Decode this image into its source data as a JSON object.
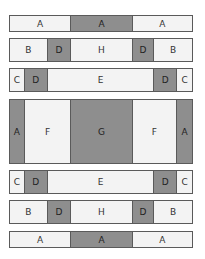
{
  "diagram": {
    "rows": [
      {
        "cells": [
          {
            "label": "A",
            "shade": "light",
            "span": 62
          },
          {
            "label": "A",
            "shade": "dark",
            "span": 62
          },
          {
            "label": "A",
            "shade": "light",
            "span": 60
          }
        ]
      },
      {
        "cells": [
          {
            "label": "B",
            "shade": "light",
            "span": 38
          },
          {
            "label": "D",
            "shade": "dark",
            "span": 24
          },
          {
            "label": "H",
            "shade": "light",
            "span": 62
          },
          {
            "label": "D",
            "shade": "dark",
            "span": 22
          },
          {
            "label": "B",
            "shade": "light",
            "span": 38
          }
        ]
      },
      {
        "cells": [
          {
            "label": "C",
            "shade": "light",
            "span": 15
          },
          {
            "label": "D",
            "shade": "dark",
            "span": 23
          },
          {
            "label": "E",
            "shade": "light",
            "span": 108
          },
          {
            "label": "D",
            "shade": "dark",
            "span": 23
          },
          {
            "label": "C",
            "shade": "light",
            "span": 15
          }
        ]
      },
      {
        "cells": [
          {
            "label": "A",
            "shade": "dark",
            "span": 15
          },
          {
            "label": "F",
            "shade": "light",
            "span": 47
          },
          {
            "label": "G",
            "shade": "dark",
            "span": 62
          },
          {
            "label": "F",
            "shade": "light",
            "span": 45
          },
          {
            "label": "A",
            "shade": "dark",
            "span": 15
          }
        ]
      },
      {
        "cells": [
          {
            "label": "C",
            "shade": "light",
            "span": 15
          },
          {
            "label": "D",
            "shade": "dark",
            "span": 23
          },
          {
            "label": "E",
            "shade": "light",
            "span": 108
          },
          {
            "label": "D",
            "shade": "dark",
            "span": 23
          },
          {
            "label": "C",
            "shade": "light",
            "span": 15
          }
        ]
      },
      {
        "cells": [
          {
            "label": "B",
            "shade": "light",
            "span": 38
          },
          {
            "label": "D",
            "shade": "dark",
            "span": 24
          },
          {
            "label": "H",
            "shade": "light",
            "span": 62
          },
          {
            "label": "D",
            "shade": "dark",
            "span": 22
          },
          {
            "label": "B",
            "shade": "light",
            "span": 38
          }
        ]
      },
      {
        "cells": [
          {
            "label": "A",
            "shade": "light",
            "span": 62
          },
          {
            "label": "A",
            "shade": "dark",
            "span": 62
          },
          {
            "label": "A",
            "shade": "light",
            "span": 60
          }
        ]
      }
    ],
    "colors": {
      "light": "#f3f3f3",
      "dark": "#8e8e8e",
      "border": "#5a5a5a"
    }
  }
}
